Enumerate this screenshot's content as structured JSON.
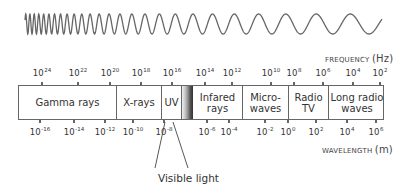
{
  "diagram": {
    "frequency_axis": {
      "label": "FREQUENCY",
      "unit": "(Hz)",
      "ticks": [
        {
          "base": "10",
          "exp": "24",
          "x": 42
        },
        {
          "base": "10",
          "exp": "22",
          "x": 78
        },
        {
          "base": "10",
          "exp": "20",
          "x": 110
        },
        {
          "base": "10",
          "exp": "18",
          "x": 141
        },
        {
          "base": "10",
          "exp": "16",
          "x": 172
        },
        {
          "base": "10",
          "exp": "14",
          "x": 205
        },
        {
          "base": "10",
          "exp": "12",
          "x": 232
        },
        {
          "base": "10",
          "exp": "10",
          "x": 271
        },
        {
          "base": "10",
          "exp": "8",
          "x": 294
        },
        {
          "base": "10",
          "exp": "6",
          "x": 323
        },
        {
          "base": "10",
          "exp": "4",
          "x": 353
        },
        {
          "base": "10",
          "exp": "2",
          "x": 380
        }
      ]
    },
    "wavelength_axis": {
      "label": "WAVELENGTH",
      "unit": "(m)",
      "ticks": [
        {
          "base": "10",
          "exp": "-16",
          "x": 40
        },
        {
          "base": "10",
          "exp": "-14",
          "x": 74
        },
        {
          "base": "10",
          "exp": "-12",
          "x": 105
        },
        {
          "base": "10",
          "exp": "-10",
          "x": 133
        },
        {
          "base": "10",
          "exp": "-8",
          "x": 164
        },
        {
          "base": "10",
          "exp": "-6",
          "x": 207
        },
        {
          "base": "10",
          "exp": "-4",
          "x": 229
        },
        {
          "base": "10",
          "exp": "-2",
          "x": 265
        },
        {
          "base": "10",
          "exp": "0",
          "x": 288
        },
        {
          "base": "10",
          "exp": "2",
          "x": 316
        },
        {
          "base": "10",
          "exp": "4",
          "x": 347
        },
        {
          "base": "10",
          "exp": "6",
          "x": 376
        }
      ]
    },
    "bands": [
      {
        "line1": "Gamma rays",
        "line2": "",
        "left": 0,
        "width": 98
      },
      {
        "line1": "X-rays",
        "line2": "",
        "left": 98,
        "width": 45
      },
      {
        "line1": "UV",
        "line2": "",
        "left": 143,
        "width": 20
      },
      {
        "line1": "Infared",
        "line2": "rays",
        "left": 174,
        "width": 50
      },
      {
        "line1": "Micro-",
        "line2": "waves",
        "left": 224,
        "width": 46
      },
      {
        "line1": "Radio",
        "line2": "TV",
        "left": 270,
        "width": 40
      },
      {
        "line1": "Long radio",
        "line2": "waves",
        "left": 310,
        "width": 56
      }
    ],
    "visible_band": {
      "left": 163,
      "width": 11
    },
    "visible_label": "Visible light",
    "colors": {
      "line": "#666666",
      "text": "#333333",
      "wave": "#666666"
    }
  }
}
